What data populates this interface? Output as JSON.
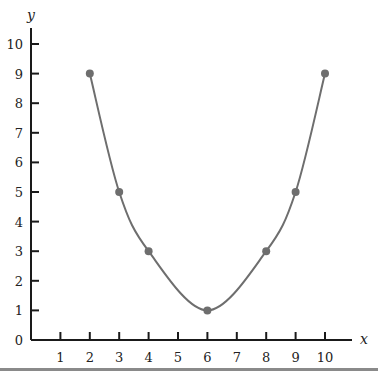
{
  "chart_data": {
    "type": "line",
    "title": "",
    "xlabel": "x",
    "ylabel": "y",
    "xlim": [
      0,
      11
    ],
    "ylim": [
      0,
      10.5
    ],
    "x_ticks": [
      1,
      2,
      3,
      4,
      5,
      6,
      7,
      8,
      9,
      10
    ],
    "y_ticks": [
      0,
      1,
      2,
      3,
      4,
      5,
      6,
      7,
      8,
      9,
      10
    ],
    "grid": false,
    "legend": null,
    "series": [
      {
        "name": "curve",
        "x": [
          2,
          3,
          4,
          6,
          8,
          9,
          10
        ],
        "values": [
          9,
          5,
          3,
          1,
          3,
          5,
          9
        ],
        "markers": true,
        "smooth": true
      }
    ]
  },
  "colors": {
    "axis": "#1a1a1a",
    "curve": "#6e6e6e",
    "marker": "#6e6e6e",
    "bottom_rule": "#8a8a8a"
  }
}
